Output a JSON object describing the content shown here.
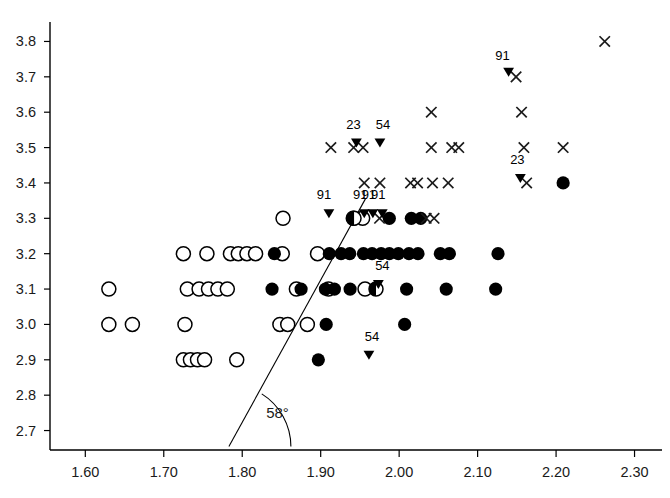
{
  "chart_data": {
    "type": "scatter",
    "title": "",
    "subtitle": "",
    "xlabel": "",
    "ylabel": "",
    "grid": false,
    "legend_position": "none",
    "xlim": [
      1.555,
      2.335
    ],
    "ylim": [
      2.645,
      3.855
    ],
    "xticks": [
      "1.60",
      "1.70",
      "1.80",
      "1.90",
      "2.00",
      "2.10",
      "2.20",
      "2.30"
    ],
    "xtick_values": [
      1.6,
      1.7,
      1.8,
      1.9,
      2.0,
      2.1,
      2.2,
      2.3
    ],
    "yticks": [
      "2.7",
      "2.8",
      "2.9",
      "3.0",
      "3.1",
      "3.2",
      "3.3",
      "3.4",
      "3.5",
      "3.6",
      "3.7",
      "3.8"
    ],
    "ytick_values": [
      2.7,
      2.8,
      2.9,
      3.0,
      3.1,
      3.2,
      3.3,
      3.4,
      3.5,
      3.6,
      3.7,
      3.8
    ],
    "annotations": [
      {
        "text": "58°",
        "x": 1.845,
        "y": 2.735,
        "name": "angle-label"
      }
    ],
    "angle_marker": {
      "label": "58°",
      "vertex_x": 1.783,
      "vertex_y": 2.655,
      "radius_px": 62,
      "start_deg": 0,
      "end_deg": 58
    },
    "regression_line": {
      "name": "58-degree-line",
      "x1": 1.783,
      "y1": 2.655,
      "x2": 1.957,
      "y2": 3.355,
      "slope_degrees": 58,
      "color": "#000000",
      "width_px": 1.1
    },
    "series": [
      {
        "name": "open-circle",
        "marker": "open_circle",
        "color": "#000000",
        "fill": "#ffffff",
        "points": [
          [
            1.63,
            3.1
          ],
          [
            1.63,
            3.0
          ],
          [
            1.66,
            3.0
          ],
          [
            1.725,
            3.2
          ],
          [
            1.755,
            3.2
          ],
          [
            1.73,
            3.1
          ],
          [
            1.745,
            3.1
          ],
          [
            1.757,
            3.1
          ],
          [
            1.769,
            3.1
          ],
          [
            1.781,
            3.1
          ],
          [
            1.725,
            2.9
          ],
          [
            1.734,
            2.9
          ],
          [
            1.743,
            2.9
          ],
          [
            1.752,
            2.9
          ],
          [
            1.785,
            3.2
          ],
          [
            1.795,
            3.2
          ],
          [
            1.806,
            3.2
          ],
          [
            1.817,
            3.2
          ],
          [
            1.727,
            3.0
          ],
          [
            1.793,
            2.9
          ],
          [
            1.851,
            3.2
          ],
          [
            1.848,
            3.0
          ],
          [
            1.858,
            3.0
          ],
          [
            1.852,
            3.3
          ],
          [
            1.883,
            3.0
          ],
          [
            1.869,
            3.1
          ],
          [
            1.896,
            3.2
          ],
          [
            1.91,
            3.1
          ],
          [
            1.9415,
            3.3
          ],
          [
            1.9535,
            3.3
          ],
          [
            1.9565,
            3.1
          ]
        ]
      },
      {
        "name": "filled-circle",
        "marker": "filled_circle",
        "color": "#000000",
        "fill": "#000000",
        "points": [
          [
            1.841,
            3.2
          ],
          [
            1.838,
            3.1
          ],
          [
            1.875,
            3.1
          ],
          [
            1.906,
            3.1
          ],
          [
            1.9175,
            3.1
          ],
          [
            1.911,
            3.2
          ],
          [
            1.926,
            3.2
          ],
          [
            1.937,
            3.2
          ],
          [
            1.9375,
            3.1
          ],
          [
            1.897,
            2.9
          ],
          [
            1.907,
            3.0
          ],
          [
            1.9545,
            3.2
          ],
          [
            1.9655,
            3.2
          ],
          [
            1.977,
            3.2
          ],
          [
            1.9875,
            3.2
          ],
          [
            1.999,
            3.2
          ],
          [
            2.0125,
            3.2
          ],
          [
            2.024,
            3.2
          ],
          [
            1.9875,
            3.3
          ],
          [
            2.0155,
            3.3
          ],
          [
            2.0275,
            3.3
          ],
          [
            2.0095,
            3.1
          ],
          [
            2.007,
            3.0
          ],
          [
            2.0525,
            3.2
          ],
          [
            2.064,
            3.2
          ],
          [
            2.06,
            3.1
          ],
          [
            2.126,
            3.2
          ],
          [
            2.123,
            3.1
          ],
          [
            2.209,
            3.4
          ]
        ]
      },
      {
        "name": "half-filled-circle",
        "marker": "half_circle",
        "color": "#000000",
        "fill": "#000000",
        "points": [
          [
            1.9425,
            3.3
          ],
          [
            1.9705,
            3.1
          ]
        ]
      },
      {
        "name": "x-marker",
        "marker": "x",
        "color": "#1a1a1a",
        "points": [
          [
            1.913,
            3.5
          ],
          [
            1.942,
            3.5
          ],
          [
            1.954,
            3.5
          ],
          [
            2.041,
            3.5
          ],
          [
            2.067,
            3.5
          ],
          [
            2.076,
            3.5
          ],
          [
            2.159,
            3.5
          ],
          [
            2.209,
            3.5
          ],
          [
            1.975,
            3.3
          ],
          [
            2.0345,
            3.3
          ],
          [
            2.0445,
            3.3
          ],
          [
            1.9555,
            3.4
          ],
          [
            1.9755,
            3.4
          ],
          [
            2.0145,
            3.4
          ],
          [
            2.0235,
            3.4
          ],
          [
            2.0425,
            3.4
          ],
          [
            2.0625,
            3.4
          ],
          [
            2.1625,
            3.4
          ],
          [
            2.041,
            3.6
          ],
          [
            2.156,
            3.6
          ],
          [
            2.149,
            3.7
          ],
          [
            2.262,
            3.8
          ]
        ]
      },
      {
        "name": "labeled-triangle",
        "marker": "down_triangle",
        "color": "#000000",
        "points": [
          {
            "x": 1.9105,
            "y": 3.3,
            "label": "91",
            "label_dx": -5,
            "label_dy": -11
          },
          {
            "x": 1.9555,
            "y": 3.3,
            "label": "91",
            "label_dx": -4,
            "label_dy": -11
          },
          {
            "x": 1.9665,
            "y": 3.3,
            "label": "91",
            "label_dx": -4,
            "label_dy": -11
          },
          {
            "x": 1.9785,
            "y": 3.3,
            "label": "91",
            "label_dx": -4,
            "label_dy": -11
          },
          {
            "x": 1.9735,
            "y": 3.1,
            "label": "54",
            "label_dx": 4,
            "label_dy": -11
          },
          {
            "x": 1.9615,
            "y": 2.9,
            "label": "54",
            "label_dx": 3,
            "label_dy": -11
          },
          {
            "x": 1.9755,
            "y": 3.5,
            "label": "54",
            "label_dx": 3,
            "label_dy": -11
          },
          {
            "x": 1.9455,
            "y": 3.5,
            "label": "23",
            "label_dx": -3,
            "label_dy": -11
          },
          {
            "x": 2.1545,
            "y": 3.4,
            "label": "23",
            "label_dx": -3,
            "label_dy": -11
          },
          {
            "x": 2.1395,
            "y": 3.7,
            "label": "91",
            "label_dx": -6,
            "label_dy": -9
          }
        ]
      }
    ]
  },
  "axes": {
    "x_axis_name": "x-axis",
    "y_axis_name": "y-axis"
  }
}
